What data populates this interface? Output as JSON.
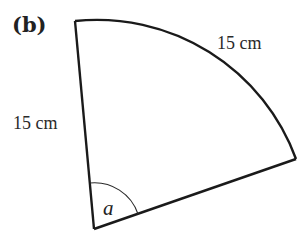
{
  "figure": {
    "part_label": "(b)",
    "shape": "sector",
    "radius_label": "15 cm",
    "arc_label": "15 cm",
    "angle_label": "a",
    "colors": {
      "stroke": "#1a1a1a",
      "text": "#222222",
      "background": "#ffffff"
    }
  }
}
